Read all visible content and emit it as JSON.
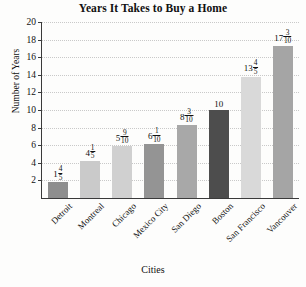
{
  "chart_data": {
    "type": "bar",
    "title": "Years It Takes to Buy a Home",
    "xlabel": "Cities",
    "ylabel": "Number of Years",
    "ylim": [
      0,
      20
    ],
    "ytick_step": 2,
    "yticks": [
      2,
      4,
      6,
      8,
      10,
      12,
      14,
      16,
      18,
      20
    ],
    "ytick_labels": [
      "2",
      "4",
      "6",
      "8",
      "10",
      "12",
      "14",
      "16",
      "18",
      "20"
    ],
    "grid": true,
    "legend": false,
    "categories": [
      "Detroit",
      "Montreal",
      "Chicago",
      "Mexico City",
      "San Diego",
      "Boston",
      "San Francisco",
      "Vancouver"
    ],
    "values": [
      1.8,
      4.2,
      5.9,
      6.1,
      8.3,
      10,
      13.8,
      17.3
    ],
    "value_labels": [
      {
        "whole": "1",
        "numerator": "4",
        "denominator": "5"
      },
      {
        "whole": "4",
        "numerator": "1",
        "denominator": "5"
      },
      {
        "whole": "5",
        "numerator": "9",
        "denominator": "10"
      },
      {
        "whole": "6",
        "numerator": "1",
        "denominator": "10"
      },
      {
        "whole": "8",
        "numerator": "3",
        "denominator": "10"
      },
      {
        "whole": "10",
        "numerator": "",
        "denominator": ""
      },
      {
        "whole": "13",
        "numerator": "4",
        "denominator": "5"
      },
      {
        "whole": "17",
        "numerator": "3",
        "denominator": "10"
      }
    ],
    "bar_colors": [
      "#8e8e8e",
      "#cacaca",
      "#d0d0d0",
      "#949494",
      "#a8a8a8",
      "#4d4d4d",
      "#d9d9d9",
      "#a5a5a5"
    ],
    "axis_color": "#3a3a3a",
    "gridline_color": "#c9c9c9",
    "background_color": "#fdfdfc"
  }
}
